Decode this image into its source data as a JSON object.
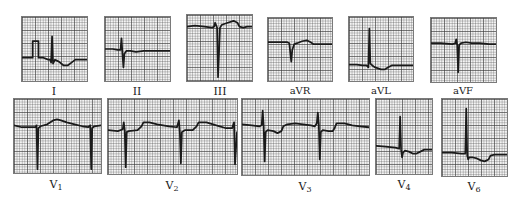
{
  "figure": {
    "grid_color": "#7a7a7a",
    "trace_color": "#1a1a1a",
    "background": "#f4f4f4"
  },
  "limb_leads": [
    {
      "id": "I",
      "label": "I"
    },
    {
      "id": "II",
      "label": "II"
    },
    {
      "id": "III",
      "label": "III"
    },
    {
      "id": "aVR",
      "label": "aVR"
    },
    {
      "id": "aVL",
      "label": "aVL"
    },
    {
      "id": "aVF",
      "label": "aVF"
    }
  ],
  "precordial_leads": [
    {
      "id": "V1",
      "label_main": "V",
      "label_sub": "1"
    },
    {
      "id": "V2",
      "label_main": "V",
      "label_sub": "2"
    },
    {
      "id": "V3",
      "label_main": "V",
      "label_sub": "3"
    },
    {
      "id": "V4",
      "label_main": "V",
      "label_sub": "4"
    },
    {
      "id": "V6",
      "label_main": "V",
      "label_sub": "6"
    }
  ]
}
